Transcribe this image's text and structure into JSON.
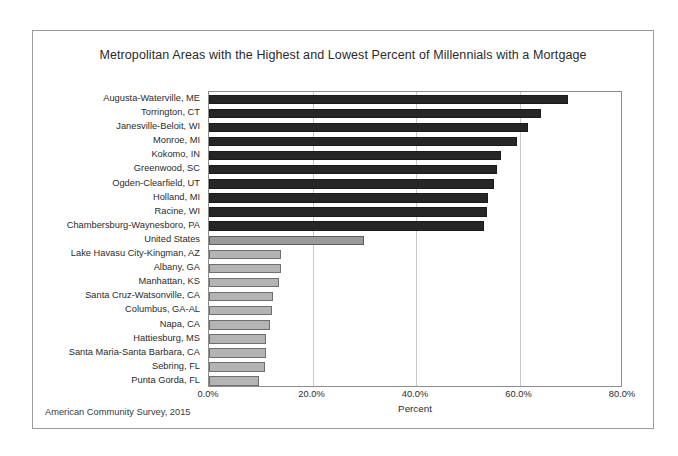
{
  "chart_data": {
    "type": "bar",
    "orientation": "horizontal",
    "title": "Metropolitan Areas with the Highest and Lowest Percent of Millennials with a Mortgage",
    "xlabel": "Percent",
    "ylabel": "",
    "xlim": [
      0,
      80
    ],
    "xticks": [
      "0.0%",
      "20.0%",
      "40.0%",
      "60.0%",
      "80.0%"
    ],
    "xtick_values": [
      0,
      20,
      40,
      60,
      80
    ],
    "grid": "vertical",
    "legend": "none",
    "source_note": "American Community Survey, 2015",
    "categories": [
      "Augusta-Waterville, ME",
      "Torrington, CT",
      "Janesville-Beloit, WI",
      "Monroe, MI",
      "Kokomo, IN",
      "Greenwood, SC",
      "Ogden-Clearfield, UT",
      "Holland, MI",
      "Racine, WI",
      "Chambersburg-Waynesboro, PA",
      "United States",
      "Lake Havasu City-Kingman, AZ",
      "Albany, GA",
      "Manhattan, KS",
      "Santa Cruz-Watsonville, CA",
      "Columbus, GA-AL",
      "Napa, CA",
      "Hattiesburg, MS",
      "Santa Maria-Santa Barbara, CA",
      "Sebring, FL",
      "Punta Gorda, FL"
    ],
    "values": [
      69.3,
      64.2,
      61.6,
      59.5,
      56.4,
      55.7,
      55.1,
      53.9,
      53.7,
      53.2,
      29.9,
      13.9,
      13.9,
      13.5,
      12.4,
      12.2,
      11.8,
      11.0,
      11.0,
      10.8,
      9.7
    ],
    "groups": [
      "high",
      "high",
      "high",
      "high",
      "high",
      "high",
      "high",
      "high",
      "high",
      "high",
      "us",
      "low",
      "low",
      "low",
      "low",
      "low",
      "low",
      "low",
      "low",
      "low",
      "low"
    ],
    "colors": {
      "high": "#262626",
      "us": "#9a9a9a",
      "low": "#b4b4b4",
      "gridline": "#c9c9c9",
      "axis": "#8d8d8d",
      "text": "#2b2b2b",
      "background": "#ffffff"
    }
  }
}
